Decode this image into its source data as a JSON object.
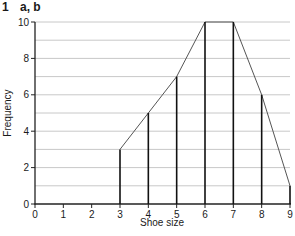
{
  "header": {
    "question_number": "1",
    "parts": "a, b"
  },
  "chart_data": {
    "type": "bar",
    "subtype": "vertical-line-graph-with-frequency-polygon",
    "title": "",
    "xlabel": "Shoe size",
    "ylabel": "Frequency",
    "categories": [
      3,
      4,
      5,
      6,
      7,
      8,
      9
    ],
    "values": [
      3,
      5,
      7,
      10,
      10,
      6,
      1
    ],
    "series": [
      {
        "name": "Frequency (vertical lines)",
        "x": [
          3,
          4,
          5,
          6,
          7,
          8,
          9
        ],
        "values": [
          3,
          5,
          7,
          10,
          10,
          6,
          1
        ]
      },
      {
        "name": "Frequency polygon",
        "x": [
          3,
          4,
          5,
          6,
          7,
          8,
          9
        ],
        "values": [
          3,
          5,
          7,
          10,
          10,
          6,
          1
        ]
      }
    ],
    "xlim": [
      0,
      9
    ],
    "ylim": [
      0,
      10
    ],
    "xticks": [
      "0",
      "1",
      "2",
      "3",
      "4",
      "5",
      "6",
      "7",
      "8",
      "9"
    ],
    "yticks": [
      "0",
      "2",
      "4",
      "6",
      "8",
      "10"
    ],
    "grid": {
      "horizontal": true,
      "vertical": false,
      "step": 1
    },
    "legend": null,
    "colors": {
      "bars": "#111111",
      "polygon": "#555555",
      "grid": "#c8c8c8",
      "axis": "#222222"
    }
  }
}
